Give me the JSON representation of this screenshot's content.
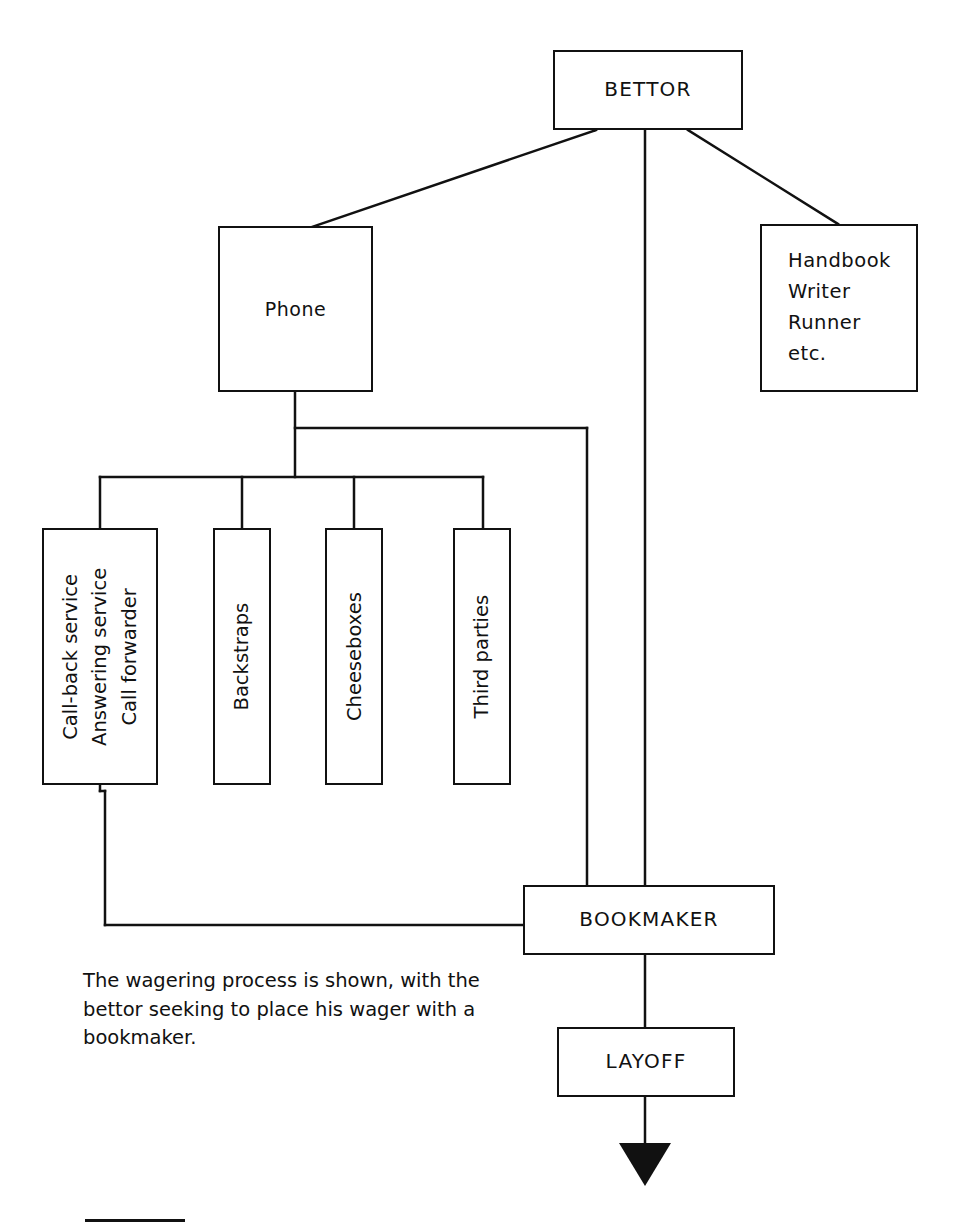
{
  "diagram": {
    "caption": "The wagering process is shown, with the bettor seeking to place his wager with a bookmaker.",
    "line_color": "#111111",
    "background": "#ffffff",
    "nodes": {
      "bettor": {
        "label": "BETTOR"
      },
      "phone": {
        "label": "Phone"
      },
      "intermediaries": {
        "line1": "Handbook",
        "line2": "Writer",
        "line3": "Runner",
        "line4": "etc."
      },
      "callback": {
        "line1": "Call-back service",
        "line2": "Answering service",
        "line3": "Call forwarder"
      },
      "backstraps": {
        "label": "Backstraps"
      },
      "cheeseboxes": {
        "label": "Cheeseboxes"
      },
      "third_parties": {
        "label": "Third parties"
      },
      "bookmaker": {
        "label": "BOOKMAKER"
      },
      "layoff": {
        "label": "LAYOFF"
      }
    },
    "edges": [
      {
        "from": "bettor",
        "to": "phone",
        "style": "diagonal"
      },
      {
        "from": "bettor",
        "to": "intermediaries",
        "style": "diagonal"
      },
      {
        "from": "bettor",
        "to": "bookmaker",
        "style": "vertical"
      },
      {
        "from": "phone",
        "to": "callback",
        "style": "orthogonal"
      },
      {
        "from": "phone",
        "to": "backstraps",
        "style": "orthogonal"
      },
      {
        "from": "phone",
        "to": "cheeseboxes",
        "style": "orthogonal"
      },
      {
        "from": "phone",
        "to": "third_parties",
        "style": "orthogonal"
      },
      {
        "from": "phone",
        "to": "bookmaker",
        "style": "orthogonal"
      },
      {
        "from": "callback",
        "to": "bookmaker",
        "style": "orthogonal"
      },
      {
        "from": "bookmaker",
        "to": "layoff",
        "style": "vertical"
      },
      {
        "from": "layoff",
        "to": "output",
        "style": "arrow-down"
      }
    ]
  }
}
